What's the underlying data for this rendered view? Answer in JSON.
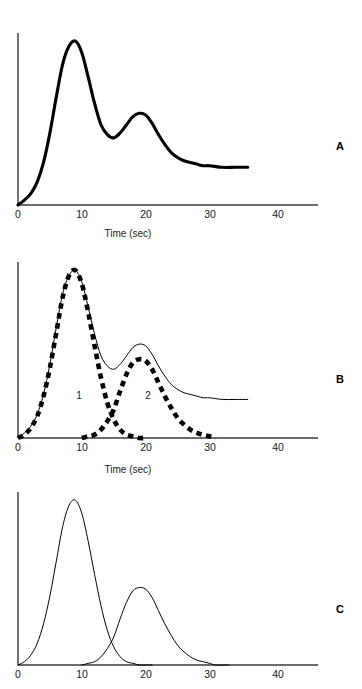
{
  "figure": {
    "background_color": "#ffffff",
    "line_color": "#000000",
    "panels": [
      {
        "letter": "A",
        "letter_x": 336,
        "letter_y": 140,
        "plot": {
          "x": 18,
          "y": 33,
          "w": 300,
          "h": 172
        },
        "axis_x_end": 318,
        "xaxis_caption": "Time (sec)",
        "caption_x": 88,
        "caption_y": 228,
        "ticks": [
          {
            "label": "0",
            "x": 18
          },
          {
            "label": "10",
            "x": 82
          },
          {
            "label": "20",
            "x": 146
          },
          {
            "label": "30",
            "x": 210
          },
          {
            "label": "40",
            "x": 278
          }
        ],
        "tick_label_y": 208
      },
      {
        "letter": "B",
        "letter_x": 336,
        "letter_y": 373,
        "plot": {
          "x": 18,
          "y": 262,
          "w": 300,
          "h": 176
        },
        "axis_x_end": 318,
        "xaxis_caption": "Time (sec)",
        "caption_x": 88,
        "caption_y": 464,
        "ticks": [
          {
            "label": "0",
            "x": 18
          },
          {
            "label": "10",
            "x": 82
          },
          {
            "label": "20",
            "x": 146
          },
          {
            "label": "30",
            "x": 210
          },
          {
            "label": "40",
            "x": 278
          }
        ],
        "tick_label_y": 441,
        "component_labels": [
          {
            "text": "1",
            "x": 72,
            "y": 390
          },
          {
            "text": "2",
            "x": 141,
            "y": 390
          }
        ]
      },
      {
        "letter": "C",
        "letter_x": 336,
        "letter_y": 603,
        "plot": {
          "x": 18,
          "y": 492,
          "w": 300,
          "h": 173
        },
        "axis_x_end": 318,
        "xaxis_caption": "",
        "caption_x": 88,
        "caption_y": 690,
        "ticks": [
          {
            "label": "0",
            "x": 18
          },
          {
            "label": "10",
            "x": 82
          },
          {
            "label": "20",
            "x": 146
          },
          {
            "label": "30",
            "x": 210
          },
          {
            "label": "40",
            "x": 278
          }
        ],
        "tick_label_y": 668
      }
    ]
  },
  "chart_data": {
    "type": "line",
    "title": "",
    "xlabel": "Time (sec)",
    "ylabel": "",
    "xlim": [
      0,
      47
    ],
    "ylim": [
      0,
      1.05
    ],
    "xticks": [
      0,
      10,
      20,
      30,
      40
    ],
    "grid": false,
    "legend": "none",
    "panels": [
      {
        "panel": "A",
        "type": "line",
        "xlabel": "Time (sec)",
        "style": "solid-thick",
        "x_data_range": [
          0,
          36
        ],
        "series": [
          {
            "name": "summed-response",
            "note": "Sum of component 1, component 2 and a sustained plateau; plotted as a single heavy solid curve.",
            "x": [
              0,
              1,
              2,
              3,
              4,
              5,
              6,
              7,
              8,
              9,
              10,
              11,
              12,
              13,
              14,
              15,
              16,
              17,
              18,
              19,
              20,
              21,
              22,
              23,
              24,
              25,
              26,
              27,
              28,
              29,
              30,
              32,
              34,
              36
            ],
            "y": [
              0.0,
              0.03,
              0.07,
              0.14,
              0.26,
              0.44,
              0.66,
              0.86,
              0.97,
              1.0,
              0.93,
              0.78,
              0.62,
              0.49,
              0.43,
              0.41,
              0.44,
              0.49,
              0.54,
              0.56,
              0.55,
              0.5,
              0.43,
              0.37,
              0.32,
              0.29,
              0.27,
              0.26,
              0.25,
              0.24,
              0.24,
              0.23,
              0.23,
              0.23
            ]
          }
        ],
        "features": {
          "peak1_time": 9,
          "peak1_value": 1.0,
          "trough_time": 15,
          "trough_value": 0.41,
          "peak2_time": 19.5,
          "peak2_value": 0.56,
          "plateau_value": 0.23
        }
      },
      {
        "panel": "B",
        "type": "line",
        "xlabel": "Time (sec)",
        "style": "solid-thin-with-dashed-components",
        "x_data_range": [
          0,
          36
        ],
        "component_labels": [
          "1",
          "2"
        ],
        "series": [
          {
            "name": "summed-response",
            "style": "solid-thin",
            "x": [
              0,
              1,
              2,
              3,
              4,
              5,
              6,
              7,
              8,
              9,
              10,
              11,
              12,
              13,
              14,
              15,
              16,
              17,
              18,
              19,
              20,
              21,
              22,
              23,
              24,
              25,
              26,
              27,
              28,
              29,
              30,
              32,
              34,
              36
            ],
            "y": [
              0.0,
              0.03,
              0.07,
              0.14,
              0.26,
              0.44,
              0.66,
              0.86,
              0.97,
              1.0,
              0.93,
              0.78,
              0.62,
              0.49,
              0.43,
              0.41,
              0.44,
              0.49,
              0.54,
              0.56,
              0.55,
              0.5,
              0.43,
              0.37,
              0.32,
              0.29,
              0.27,
              0.26,
              0.25,
              0.24,
              0.24,
              0.23,
              0.23,
              0.23
            ]
          },
          {
            "name": "component-1",
            "label": "1",
            "style": "dashed-thick",
            "peak_time": 9,
            "peak_value": 1.0,
            "x": [
              0,
              1,
              2,
              3,
              4,
              5,
              6,
              7,
              8,
              9,
              10,
              11,
              12,
              13,
              14,
              15,
              16,
              17,
              18,
              19,
              20
            ],
            "y": [
              0.0,
              0.02,
              0.06,
              0.13,
              0.25,
              0.42,
              0.63,
              0.84,
              0.97,
              1.0,
              0.92,
              0.75,
              0.55,
              0.36,
              0.21,
              0.11,
              0.05,
              0.02,
              0.01,
              0.0,
              0.0
            ]
          },
          {
            "name": "component-2",
            "label": "2",
            "style": "dashed-thick",
            "peak_time": 19.5,
            "peak_value": 0.47,
            "x": [
              10,
              11,
              12,
              13,
              14,
              15,
              16,
              17,
              18,
              19,
              20,
              21,
              22,
              23,
              24,
              25,
              26,
              27,
              28,
              29,
              30,
              31
            ],
            "y": [
              0.0,
              0.01,
              0.02,
              0.05,
              0.1,
              0.17,
              0.28,
              0.38,
              0.45,
              0.47,
              0.46,
              0.41,
              0.33,
              0.25,
              0.18,
              0.12,
              0.08,
              0.05,
              0.03,
              0.02,
              0.01,
              0.0
            ]
          }
        ]
      },
      {
        "panel": "C",
        "type": "line",
        "xlabel": "",
        "style": "solid-thin",
        "x_data_range": [
          0,
          47
        ],
        "series": [
          {
            "name": "component-1",
            "style": "solid-thin",
            "peak_time": 9,
            "peak_value": 1.0,
            "x": [
              0,
              1,
              2,
              3,
              4,
              5,
              6,
              7,
              8,
              9,
              10,
              11,
              12,
              13,
              14,
              15,
              16,
              17,
              18,
              19,
              20,
              21
            ],
            "y": [
              0.0,
              0.02,
              0.06,
              0.13,
              0.25,
              0.42,
              0.63,
              0.84,
              0.97,
              1.0,
              0.92,
              0.75,
              0.55,
              0.36,
              0.21,
              0.11,
              0.05,
              0.02,
              0.01,
              0.0,
              0.0,
              0.0
            ]
          },
          {
            "name": "component-2",
            "style": "solid-thin",
            "peak_time": 19.5,
            "peak_value": 0.47,
            "x": [
              10,
              11,
              12,
              13,
              14,
              15,
              16,
              17,
              18,
              19,
              20,
              21,
              22,
              23,
              24,
              25,
              26,
              27,
              28,
              29,
              30,
              31,
              33
            ],
            "y": [
              0.0,
              0.01,
              0.02,
              0.05,
              0.1,
              0.17,
              0.28,
              0.38,
              0.45,
              0.47,
              0.46,
              0.41,
              0.33,
              0.25,
              0.18,
              0.12,
              0.08,
              0.05,
              0.03,
              0.02,
              0.01,
              0.0,
              0.0
            ]
          }
        ]
      }
    ]
  }
}
